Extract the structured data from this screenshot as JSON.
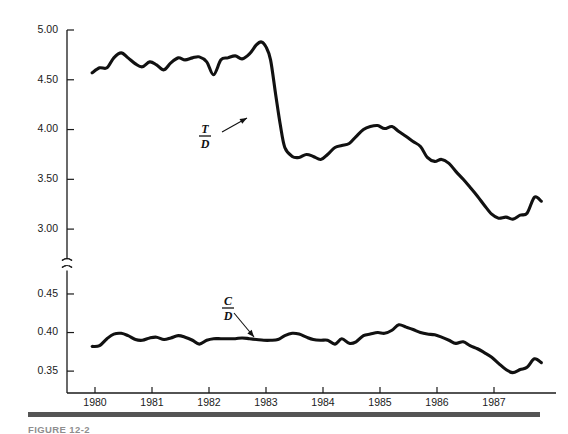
{
  "figure": {
    "caption": "FIGURE 12-2",
    "background": "#ffffff",
    "line_color": "#111111",
    "axis_color": "#1a1a1a",
    "rule_color": "#555555"
  },
  "annotations": [
    {
      "name": "td-label",
      "numerator": "T",
      "denominator": "D",
      "x": 205,
      "y": 133,
      "arrow_from_x": 222,
      "arrow_from_y": 132,
      "arrow_to_x": 247,
      "arrow_to_y": 118
    },
    {
      "name": "cd-label",
      "numerator": "C",
      "denominator": "D",
      "x": 228,
      "y": 305,
      "arrow_from_x": 234,
      "arrow_from_y": 313,
      "arrow_to_x": 254,
      "arrow_to_y": 337
    }
  ],
  "chart_data": {
    "type": "line",
    "title": "",
    "xlabel": "",
    "ylabel": "",
    "grid": false,
    "legend": "none",
    "broken_axis": true,
    "axis_break_between": [
      3.0,
      0.45
    ],
    "x_ticks": [
      1980,
      1981,
      1982,
      1983,
      1984,
      1985,
      1986,
      1987
    ],
    "x_tick_labels": [
      "1980",
      "1981",
      "1982",
      "1983",
      "1984",
      "1985",
      "1986",
      "1987"
    ],
    "xlim": [
      1979.55,
      1987.95
    ],
    "upper_panel": {
      "y_ticks": [
        3.0,
        3.5,
        4.0,
        4.5,
        5.0
      ],
      "y_tick_labels": [
        "3.00",
        "3.50",
        "4.00",
        "4.50",
        "5.00"
      ],
      "ylim": [
        2.77,
        5.0
      ]
    },
    "lower_panel": {
      "y_ticks": [
        0.35,
        0.4,
        0.45
      ],
      "y_tick_labels": [
        "0.35",
        "0.40",
        "0.45"
      ],
      "ylim": [
        0.332,
        0.472
      ]
    },
    "series": [
      {
        "name": "T/D",
        "label": "T/D",
        "panel": "upper",
        "x": [
          1979.95,
          1980.08,
          1980.21,
          1980.33,
          1980.46,
          1980.58,
          1980.71,
          1980.83,
          1980.96,
          1981.08,
          1981.21,
          1981.33,
          1981.46,
          1981.58,
          1981.71,
          1981.83,
          1981.96,
          1982.08,
          1982.21,
          1982.33,
          1982.46,
          1982.58,
          1982.71,
          1982.83,
          1982.92,
          1983.0,
          1983.08,
          1983.17,
          1983.25,
          1983.33,
          1983.46,
          1983.58,
          1983.71,
          1983.83,
          1983.96,
          1984.08,
          1984.21,
          1984.33,
          1984.46,
          1984.58,
          1984.71,
          1984.83,
          1984.96,
          1985.08,
          1985.21,
          1985.33,
          1985.46,
          1985.58,
          1985.71,
          1985.83,
          1985.96,
          1986.08,
          1986.21,
          1986.33,
          1986.46,
          1986.58,
          1986.71,
          1986.83,
          1986.96,
          1987.08,
          1987.21,
          1987.33,
          1987.46,
          1987.58,
          1987.71,
          1987.83
        ],
        "y": [
          4.57,
          4.62,
          4.62,
          4.72,
          4.77,
          4.72,
          4.66,
          4.63,
          4.68,
          4.65,
          4.6,
          4.67,
          4.72,
          4.7,
          4.72,
          4.73,
          4.68,
          4.55,
          4.7,
          4.72,
          4.74,
          4.71,
          4.76,
          4.85,
          4.88,
          4.83,
          4.7,
          4.35,
          4.05,
          3.82,
          3.73,
          3.72,
          3.75,
          3.73,
          3.7,
          3.75,
          3.82,
          3.84,
          3.86,
          3.93,
          4.0,
          4.03,
          4.04,
          4.01,
          4.03,
          3.98,
          3.93,
          3.88,
          3.83,
          3.72,
          3.68,
          3.7,
          3.66,
          3.58,
          3.5,
          3.42,
          3.33,
          3.24,
          3.15,
          3.11,
          3.12,
          3.1,
          3.14,
          3.16,
          3.32,
          3.28
        ]
      },
      {
        "name": "C/D",
        "label": "C/D",
        "panel": "lower",
        "x": [
          1979.95,
          1980.08,
          1980.21,
          1980.33,
          1980.46,
          1980.58,
          1980.71,
          1980.83,
          1980.96,
          1981.08,
          1981.21,
          1981.33,
          1981.46,
          1981.58,
          1981.71,
          1981.83,
          1981.96,
          1982.08,
          1982.21,
          1982.33,
          1982.46,
          1982.58,
          1982.71,
          1982.83,
          1982.96,
          1983.08,
          1983.21,
          1983.33,
          1983.46,
          1983.58,
          1983.71,
          1983.83,
          1983.96,
          1984.08,
          1984.21,
          1984.33,
          1984.46,
          1984.58,
          1984.71,
          1984.83,
          1984.96,
          1985.08,
          1985.21,
          1985.33,
          1985.46,
          1985.58,
          1985.71,
          1985.83,
          1985.96,
          1986.08,
          1986.21,
          1986.33,
          1986.46,
          1986.58,
          1986.71,
          1986.83,
          1986.96,
          1987.08,
          1987.21,
          1987.33,
          1987.46,
          1987.58,
          1987.71,
          1987.83
        ],
        "y": [
          0.382,
          0.383,
          0.392,
          0.398,
          0.399,
          0.396,
          0.391,
          0.39,
          0.393,
          0.394,
          0.391,
          0.393,
          0.396,
          0.394,
          0.39,
          0.385,
          0.39,
          0.392,
          0.392,
          0.392,
          0.392,
          0.393,
          0.392,
          0.391,
          0.39,
          0.39,
          0.391,
          0.396,
          0.399,
          0.398,
          0.394,
          0.391,
          0.39,
          0.39,
          0.385,
          0.392,
          0.386,
          0.388,
          0.396,
          0.398,
          0.4,
          0.399,
          0.403,
          0.41,
          0.407,
          0.404,
          0.4,
          0.398,
          0.397,
          0.394,
          0.39,
          0.386,
          0.388,
          0.383,
          0.379,
          0.374,
          0.368,
          0.36,
          0.352,
          0.348,
          0.352,
          0.355,
          0.366,
          0.361
        ]
      }
    ]
  }
}
